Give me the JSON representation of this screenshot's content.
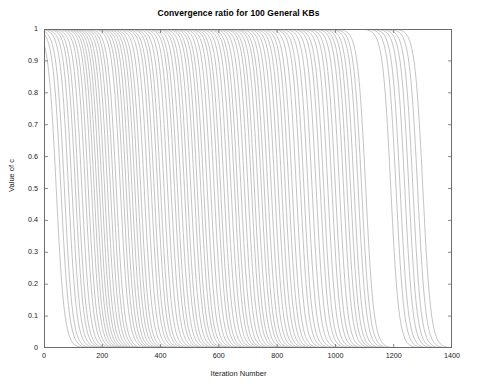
{
  "chart_data": {
    "type": "line",
    "title": "Convergence ratio for 100 General KBs",
    "xlabel": "Iteration Number",
    "ylabel": "Value of c",
    "xlim": [
      0,
      1400
    ],
    "ylim": [
      0,
      1
    ],
    "xticks": [
      0,
      200,
      400,
      600,
      800,
      1000,
      1200,
      1400
    ],
    "xtick_labels": [
      "0",
      "200",
      "400",
      "600",
      "800",
      "1000",
      "1200",
      "1400"
    ],
    "yticks": [
      0,
      0.1,
      0.2,
      0.3,
      0.4,
      0.5,
      0.6,
      0.7,
      0.8,
      0.9,
      1
    ],
    "ytick_labels": [
      "0",
      "0.1",
      "0.2",
      "0.3",
      "0.4",
      "0.5",
      "0.6",
      "0.7",
      "0.8",
      "0.9",
      "1"
    ],
    "grid": false,
    "legend": null,
    "legend_position": "none",
    "series_count": 100,
    "line_color": "#8c8c8c",
    "axis_color": "#6b6b6b",
    "background": "#ffffff",
    "series_dropoff_iterations": [
      42,
      58,
      70,
      84,
      96,
      108,
      118,
      130,
      142,
      152,
      163,
      172,
      181,
      190,
      199,
      208,
      218,
      228,
      238,
      248,
      262,
      272,
      282,
      292,
      302,
      312,
      322,
      332,
      344,
      356,
      368,
      378,
      390,
      400,
      412,
      424,
      436,
      448,
      458,
      470,
      482,
      492,
      504,
      516,
      526,
      538,
      548,
      560,
      572,
      584,
      596,
      606,
      618,
      630,
      642,
      654,
      664,
      676,
      688,
      700,
      712,
      722,
      734,
      746,
      756,
      768,
      780,
      792,
      804,
      816,
      828,
      840,
      852,
      866,
      880,
      892,
      906,
      920,
      934,
      948,
      960,
      974,
      988,
      1000,
      1014,
      1028,
      1040,
      1052,
      1064,
      1078,
      1090,
      1104,
      1190,
      1208,
      1222,
      1238,
      1252,
      1266,
      1282,
      1300
    ],
    "dropoff_steepness": 0.072
  }
}
